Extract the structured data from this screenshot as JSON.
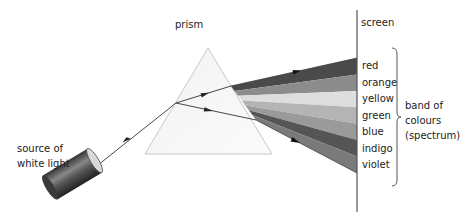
{
  "diagram": {
    "labels": {
      "source": [
        "source of",
        "white light"
      ],
      "prism": "prism",
      "screen": "screen",
      "band": [
        "band of",
        "colours",
        "(spectrum)"
      ]
    },
    "spectrum": [
      {
        "name": "red",
        "shade": "#4a4a4a"
      },
      {
        "name": "orange",
        "shade": "#8c8c8c"
      },
      {
        "name": "yellow",
        "shade": "#dedede"
      },
      {
        "name": "green",
        "shade": "#b2b2b2"
      },
      {
        "name": "blue",
        "shade": "#9a9a9a"
      },
      {
        "name": "indigo",
        "shade": "#555555"
      },
      {
        "name": "violet",
        "shade": "#7a7a7a"
      }
    ]
  }
}
